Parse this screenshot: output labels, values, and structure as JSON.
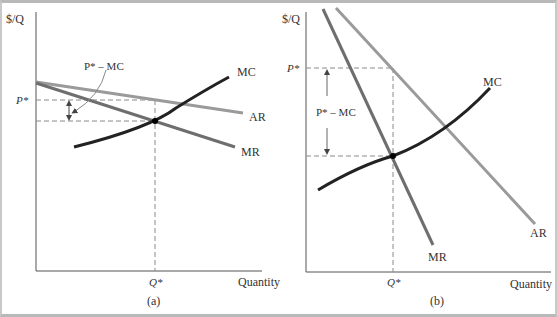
{
  "panels": [
    {
      "id": "a",
      "caption": "(a)",
      "y_axis_label": "$/Q",
      "x_axis_label": "Quantity",
      "price_label": "P*",
      "quantity_label": "Q*",
      "markup_label": "P* – MC",
      "curves": {
        "mc": "MC",
        "ar": "AR",
        "mr": "MR"
      }
    },
    {
      "id": "b",
      "caption": "(b)",
      "y_axis_label": "$/Q",
      "x_axis_label": "Quantity",
      "price_label": "P*",
      "quantity_label": "Q*",
      "markup_label": "P* – MC",
      "curves": {
        "mc": "MC",
        "ar": "AR",
        "mr": "MR"
      }
    }
  ],
  "colors": {
    "mc": "#222222",
    "ar": "#9a9a9a",
    "mr": "#6e6e6e",
    "axis": "#555555",
    "dashed": "#8a8a8a",
    "frame": "#b9b9b9"
  }
}
